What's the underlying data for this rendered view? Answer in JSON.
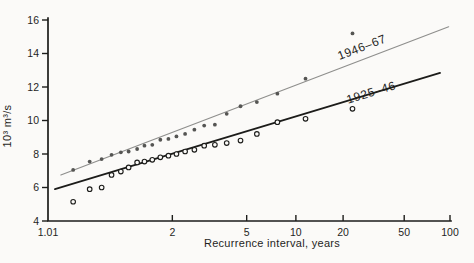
{
  "figure": {
    "background": "#fbfaf8",
    "axis_color": "#1d1d1b",
    "text_color": "#1f1f1d"
  },
  "chart_data": {
    "type": "scatter",
    "x_scale": "gumbel-probability",
    "xlabel": "Recurrence interval, years",
    "ylabel": "10³ m³/s",
    "xlim": [
      1.01,
      100
    ],
    "ylim": [
      4,
      16
    ],
    "grid": false,
    "x_ticks": [
      1.01,
      2,
      5,
      10,
      20,
      50,
      100
    ],
    "x_tick_labels": [
      "1.01",
      "2",
      "5",
      "10",
      "20",
      "50",
      "100"
    ],
    "y_ticks": [
      4,
      6,
      8,
      10,
      12,
      14,
      16
    ],
    "y_tick_labels": [
      "4",
      "6",
      "8",
      "10",
      "12",
      "14",
      "16"
    ],
    "x": [
      1.045,
      1.095,
      1.15,
      1.21,
      1.28,
      1.35,
      1.44,
      1.53,
      1.64,
      1.77,
      1.92,
      2.09,
      2.3,
      2.56,
      2.88,
      3.29,
      3.83,
      4.6,
      5.75,
      7.67,
      11.5,
      23
    ],
    "series": [
      {
        "name": "1946–67",
        "marker": "filled-dot",
        "marker_color": "#555553",
        "line_color": "#8e8e8c",
        "line_width": 1.1,
        "values": [
          7.05,
          7.55,
          7.7,
          7.95,
          8.1,
          8.15,
          8.3,
          8.5,
          8.55,
          8.85,
          8.9,
          9.05,
          9.2,
          9.45,
          9.7,
          9.75,
          10.4,
          10.85,
          11.1,
          11.6,
          12.5,
          15.2
        ],
        "fit_line": {
          "x1": 1.023,
          "y1": 6.75,
          "x2": 98,
          "y2": 15.6
        },
        "label": {
          "text": "1946–67",
          "x": 27,
          "y": 14.15,
          "angle": -21
        }
      },
      {
        "name": "1925–46",
        "marker": "open-circle",
        "marker_color": "#1c1c1a",
        "line_color": "#1c1c1a",
        "line_width": 1.8,
        "values": [
          5.15,
          5.9,
          6.0,
          6.75,
          6.95,
          7.2,
          7.5,
          7.55,
          7.65,
          7.8,
          7.9,
          8.0,
          8.15,
          8.25,
          8.5,
          8.55,
          8.65,
          8.8,
          9.2,
          9.9,
          10.1,
          10.7
        ],
        "fit_line": {
          "x1": 1.016,
          "y1": 5.9,
          "x2": 86,
          "y2": 12.84
        },
        "label": {
          "text": "1925–46",
          "x": 31,
          "y": 11.45,
          "angle": -17
        }
      }
    ]
  }
}
